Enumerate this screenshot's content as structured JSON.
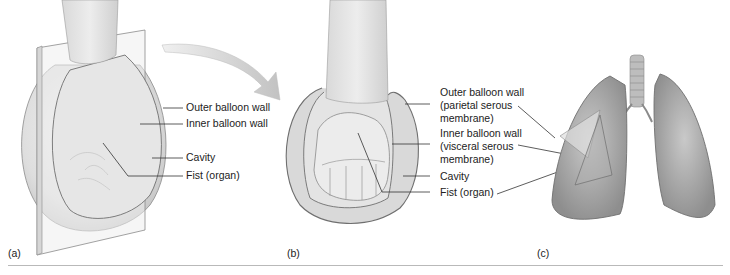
{
  "figure": {
    "panels": [
      {
        "id": "a",
        "label": "(a)",
        "callouts": [
          "Outer balloon wall",
          "Inner balloon wall",
          "Cavity",
          "Fist (organ)"
        ]
      },
      {
        "id": "b",
        "label": "(b)",
        "callouts": [
          {
            "line1": "Outer balloon wall",
            "line2": "(parietal serous",
            "line3": "membrane)"
          },
          {
            "line1": "Inner balloon wall",
            "line2": "(visceral serous",
            "line3": "membrane)"
          },
          {
            "line1": "Cavity"
          },
          {
            "line1": "Fist (organ)"
          }
        ]
      },
      {
        "id": "c",
        "label": "(c)",
        "subject": "lungs with pleural membranes"
      }
    ],
    "colors": {
      "tissue": "#dcdcdc",
      "tissue_dark": "#a8a8a8",
      "outline": "#6f6f6f",
      "leader": "#333333",
      "rule": "#b9b9b9"
    }
  }
}
